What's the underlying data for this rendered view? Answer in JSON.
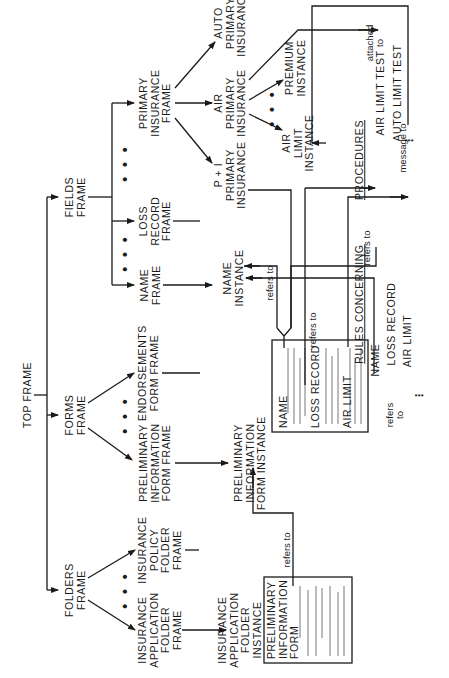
{
  "diagram": {
    "orientation": "rotated -90deg (text reads bottom-to-top)",
    "nodes": {
      "top_frame": "TOP FRAME",
      "fields_frame": "FIELDS\nFRAME",
      "forms_frame": "FORMS\nFRAME",
      "folders_frame": "FOLDERS\nFRAME",
      "primary_insurance_frame": "PRIMARY\nINSURANCE\nFRAME",
      "loss_record_frame": "LOSS\nRECORD\nFRAME",
      "name_frame": "NAME\nFRAME",
      "auto_primary_insurance": "AUTO\nPRIMARY\nINSURANCE",
      "air_primary_insurance": "AIR\nPRIMARY\nINSURANCE",
      "pi_primary_insurance": "P + I\nPRIMARY\nINSURANCE",
      "premium_instance": "PREMIUM\nINSTANCE",
      "air_limit_instance": "AIR\nLIMIT\nINSTANCE",
      "name_instance": "NAME\nINSTANCE",
      "endorsements_form_frame": "ENDORSEMENTS\nFORM FRAME",
      "preliminary_information_form_frame": "PRELIMINARY\nINFORMATION\nFORM FRAME",
      "preliminary_information_form_instance": "PRELIMINARY\nINFORMATION\nFORM INSTANCE",
      "insurance_policy_folder_frame": "INSURANCE\nPOLICY\nFOLDER\nFRAME",
      "insurance_application_folder_frame": "INSURANCE\nAPPLICATION\nFOLDER\nFRAME",
      "insurance_application_folder_instance": "INSURANCE\nAPPLICATION\nFOLDER\nINSTANCE"
    },
    "form_instance_fields": {
      "name": "NAME",
      "loss_record": "LOSS RECORD",
      "air_limit": "AIR LIMIT"
    },
    "folder_instance_fields": {
      "preliminary_information_form": "PRELIMINARY\nINFORMATION\nFORM"
    },
    "procedures": {
      "heading": "PROCEDURES",
      "items": [
        "AIR LIMIT TEST",
        "AUTO LIMIT TEST"
      ],
      "more": "⋮"
    },
    "rules": {
      "heading": "RULES CONCERNING",
      "items": [
        "NAME",
        "LOSS RECORD",
        "AIR LIMIT"
      ],
      "more": "⋮"
    },
    "edge_labels": {
      "attached_to": "attached\nto",
      "refers_to_1": "refers to",
      "refers_to_2": "refers to",
      "refers_to_3": "refers to",
      "refers_to_4": "refers\nto",
      "refers_to_5": "refers to",
      "message_to": "message to"
    },
    "ellipsis": "• • •"
  }
}
